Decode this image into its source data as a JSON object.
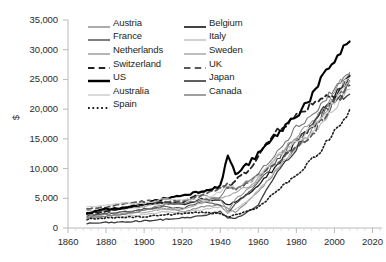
{
  "chart_data": {
    "type": "line",
    "title": "",
    "xlabel": "",
    "ylabel": "$",
    "xlim": [
      1860,
      2025
    ],
    "ylim": [
      0,
      35000
    ],
    "xticks": [
      "1860",
      "1880",
      "1900",
      "1920",
      "1940",
      "1960",
      "1980",
      "2000",
      "2020"
    ],
    "xtick_values": [
      1860,
      1880,
      1900,
      1920,
      1940,
      1960,
      1980,
      2000,
      2020
    ],
    "yticks": [
      "0",
      "5,000",
      "10,000",
      "15,000",
      "20,000",
      "25,000",
      "30,000",
      "35,000"
    ],
    "ytick_values": [
      0,
      5000,
      10000,
      15000,
      20000,
      25000,
      30000,
      35000
    ],
    "grid": false,
    "legend_position": "top-center",
    "x": [
      1870,
      1880,
      1890,
      1900,
      1910,
      1920,
      1930,
      1940,
      1944,
      1948,
      1955,
      1960,
      1970,
      1980,
      1990,
      2000,
      2008
    ],
    "series": [
      {
        "name": "Austria",
        "color": "#8c8c8c",
        "style": "solid",
        "width": 1.1,
        "values": [
          1900,
          2250,
          2600,
          3050,
          3400,
          2700,
          3550,
          3900,
          3300,
          2600,
          4700,
          6200,
          9800,
          13500,
          17200,
          21800,
          25800
        ]
      },
      {
        "name": "Belgium",
        "color": "#1a1a1a",
        "style": "solid",
        "width": 1.3,
        "values": [
          2600,
          2950,
          3300,
          3900,
          4300,
          3900,
          4900,
          4600,
          3900,
          4400,
          5800,
          7100,
          10600,
          14600,
          17600,
          22200,
          25600
        ]
      },
      {
        "name": "France",
        "color": "#4d4d4d",
        "style": "solid",
        "width": 1.1,
        "values": [
          2100,
          2450,
          2800,
          3200,
          3600,
          3300,
          4500,
          3800,
          2500,
          4000,
          5900,
          7500,
          11600,
          15100,
          17800,
          21600,
          24800
        ]
      },
      {
        "name": "Italy",
        "color": "#bfbfbf",
        "style": "solid",
        "width": 1.1,
        "values": [
          1800,
          1950,
          2050,
          2200,
          2750,
          2600,
          3100,
          3550,
          2500,
          3100,
          4700,
          6200,
          10000,
          13700,
          16500,
          20300,
          23300
        ]
      },
      {
        "name": "Netherlands",
        "color": "#9a9a9a",
        "style": "solid",
        "width": 1.1,
        "values": [
          2800,
          3000,
          3300,
          3600,
          4300,
          4400,
          5600,
          4800,
          2700,
          4900,
          6500,
          8100,
          11900,
          15500,
          18100,
          23000,
          26200
        ]
      },
      {
        "name": "Sweden",
        "color": "#a6a6a6",
        "style": "solid",
        "width": 1.1,
        "values": [
          1700,
          2000,
          2300,
          2700,
          3100,
          3100,
          4200,
          5100,
          5400,
          6100,
          7000,
          8400,
          12100,
          14900,
          17500,
          21000,
          24700
        ]
      },
      {
        "name": "Switzerland",
        "color": "#222222",
        "style": "dashed",
        "width": 1.8,
        "values": [
          2400,
          2700,
          3400,
          4000,
          4300,
          4300,
          6200,
          6900,
          6600,
          8000,
          9900,
          12100,
          16600,
          18800,
          21500,
          22600,
          25600
        ]
      },
      {
        "name": "UK",
        "color": "#5a5a5a",
        "style": "dashed",
        "width": 1.8,
        "values": [
          3200,
          3500,
          4100,
          4500,
          4600,
          4400,
          5400,
          6700,
          7400,
          6500,
          7700,
          8900,
          11200,
          13500,
          16500,
          21000,
          24000
        ]
      },
      {
        "name": "US",
        "color": "#000000",
        "style": "solid",
        "width": 2.1,
        "values": [
          2450,
          3200,
          3400,
          4100,
          4900,
          5500,
          6200,
          7000,
          12300,
          9000,
          10900,
          12400,
          15800,
          19000,
          23000,
          28400,
          31400
        ]
      },
      {
        "name": "Japan",
        "color": "#3d3d3d",
        "style": "solid",
        "width": 1.3,
        "values": [
          760,
          900,
          1000,
          1200,
          1400,
          1700,
          2000,
          2800,
          1700,
          1600,
          2800,
          3900,
          9700,
          13400,
          18800,
          21000,
          22500
        ]
      },
      {
        "name": "Australia",
        "color": "#cccccc",
        "style": "solid",
        "width": 1.1,
        "values": [
          3500,
          3800,
          4200,
          4000,
          4900,
          4700,
          4800,
          6000,
          7200,
          6800,
          7800,
          8800,
          12000,
          14500,
          17200,
          21500,
          25300
        ]
      },
      {
        "name": "Canada",
        "color": "#7a7a7a",
        "style": "solid",
        "width": 1.1,
        "values": [
          1700,
          2000,
          2400,
          3000,
          4000,
          4100,
          4700,
          5100,
          7000,
          6600,
          7900,
          9100,
          13000,
          17000,
          19500,
          23500,
          25900
        ]
      },
      {
        "name": "Spain",
        "color": "#1f1f1f",
        "style": "dotted",
        "width": 1.6,
        "values": [
          1500,
          1650,
          1800,
          1900,
          2200,
          2400,
          2700,
          2300,
          1900,
          2200,
          2900,
          3500,
          6300,
          8800,
          12000,
          16000,
          19900
        ]
      }
    ]
  },
  "legend": {
    "items": [
      {
        "label": "Austria"
      },
      {
        "label": "France"
      },
      {
        "label": "Netherlands"
      },
      {
        "label": "Switzerland"
      },
      {
        "label": "US"
      },
      {
        "label": "Australia"
      },
      {
        "label": "Spain"
      },
      {
        "label": "Belgium"
      },
      {
        "label": "Italy"
      },
      {
        "label": "Sweden"
      },
      {
        "label": "UK"
      },
      {
        "label": "Japan"
      },
      {
        "label": "Canada"
      }
    ]
  }
}
